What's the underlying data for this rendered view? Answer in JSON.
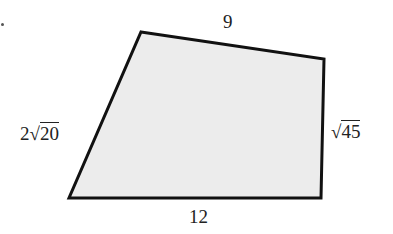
{
  "diagram": {
    "type": "quadrilateral",
    "fill_color": "#ececec",
    "stroke_color": "#111111",
    "vertices": {
      "top_left": [
        141,
        32
      ],
      "top_right": [
        324,
        59
      ],
      "bottom_right": [
        321,
        198
      ],
      "bottom_left": [
        69,
        198
      ]
    },
    "sides": {
      "top": {
        "label": "9"
      },
      "right": {
        "coef": "",
        "radical": "√",
        "radicand": "45"
      },
      "bottom": {
        "label": "12"
      },
      "left": {
        "coef": "2",
        "radical": "√",
        "radicand": "20"
      }
    }
  }
}
